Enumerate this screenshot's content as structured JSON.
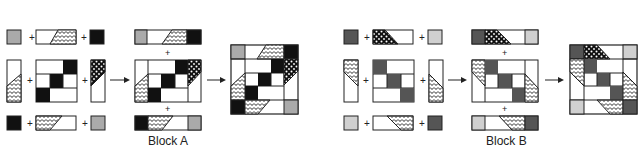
{
  "diagram": {
    "type": "quilt-block-assembly",
    "colors": {
      "black": "#111111",
      "dark_gray": "#555555",
      "medium_gray": "#aaaaaa",
      "light_gray": "#d0d0d0",
      "outline": "#222222",
      "white": "#ffffff"
    },
    "symbols": {
      "plus": "+",
      "arrow": "→"
    },
    "blocks": [
      {
        "id": "A",
        "label": "Block A",
        "steps": [
          "rows of units",
          "joined rows",
          "finished block"
        ]
      },
      {
        "id": "B",
        "label": "Block B",
        "steps": [
          "rows of units",
          "joined rows",
          "finished block"
        ]
      }
    ]
  }
}
